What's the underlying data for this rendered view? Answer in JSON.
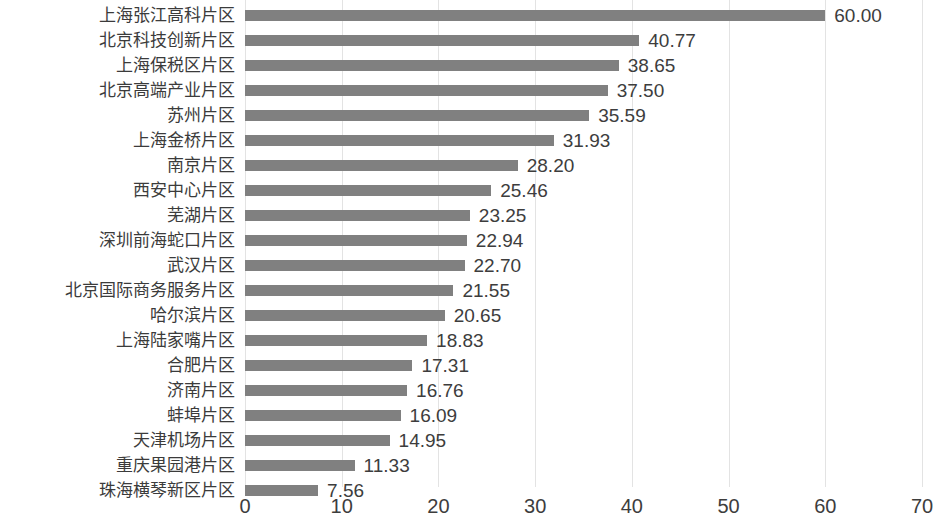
{
  "chart_data": {
    "type": "bar",
    "orientation": "horizontal",
    "title": "",
    "subtitle": "",
    "xlabel": "",
    "ylabel": "",
    "xlim": [
      0,
      70
    ],
    "xticks": [
      "0",
      "10",
      "20",
      "30",
      "40",
      "50",
      "60",
      "70"
    ],
    "xtick_step": 10,
    "grid": true,
    "grid_axis": "x",
    "legend": false,
    "legend_position": "none",
    "bar_color": "#808080",
    "gridline_color": "#e3e3e3",
    "background_color": "#ffffff",
    "text_color": "#3d3d3d",
    "data_labels": true,
    "data_label_format": "0.00",
    "categories": [
      "上海张江高科片区",
      "北京科技创新片区",
      "上海保税区片区",
      "北京高端产业片区",
      "苏州片区",
      "上海金桥片区",
      "南京片区",
      "西安中心片区",
      "芜湖片区",
      "深圳前海蛇口片区",
      "武汉片区",
      "北京国际商务服务片区",
      "哈尔滨片区",
      "上海陆家嘴片区",
      "合肥片区",
      "济南片区",
      "蚌埠片区",
      "天津机场片区",
      "重庆果园港片区",
      "珠海横琴新区片区"
    ],
    "values": [
      60.0,
      40.77,
      38.65,
      37.5,
      35.59,
      31.93,
      28.2,
      25.46,
      23.25,
      22.94,
      22.7,
      21.55,
      20.65,
      18.83,
      17.31,
      16.76,
      16.09,
      14.95,
      11.33,
      7.56
    ],
    "value_labels": [
      "60.00",
      "40.77",
      "38.65",
      "37.50",
      "35.59",
      "31.93",
      "28.20",
      "25.46",
      "23.25",
      "22.94",
      "22.70",
      "21.55",
      "20.65",
      "18.83",
      "17.31",
      "16.76",
      "16.09",
      "14.95",
      "11.33",
      "7.56"
    ]
  }
}
